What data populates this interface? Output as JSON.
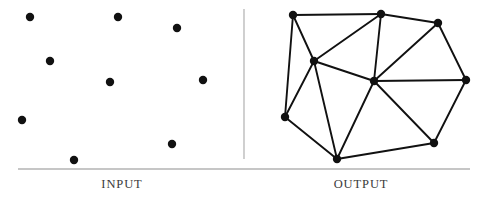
{
  "figure": {
    "width": 487,
    "height": 199,
    "background_color": "#ffffff",
    "ink_color": "#111111",
    "rule_color": "#8e8e8e",
    "divider_color": "#b0b0b0"
  },
  "divider": {
    "name": "vertical-divider",
    "x": 244,
    "y1": 9,
    "y2": 159
  },
  "baseline": {
    "name": "horizontal-rule",
    "x1": 18,
    "x2": 470,
    "y": 169
  },
  "panels": [
    {
      "id": "input",
      "caption": "INPUT",
      "description": "Scattered point set",
      "point_radius": 4.2,
      "points": [
        {
          "id": "p0",
          "x": 30,
          "y": 17
        },
        {
          "id": "p1",
          "x": 118,
          "y": 17
        },
        {
          "id": "p2",
          "x": 177,
          "y": 28
        },
        {
          "id": "p3",
          "x": 50,
          "y": 61
        },
        {
          "id": "p4",
          "x": 110,
          "y": 82
        },
        {
          "id": "p5",
          "x": 203,
          "y": 80
        },
        {
          "id": "p6",
          "x": 22,
          "y": 120
        },
        {
          "id": "p7",
          "x": 172,
          "y": 144
        },
        {
          "id": "p8",
          "x": 74,
          "y": 160
        }
      ]
    },
    {
      "id": "output",
      "caption": "OUTPUT",
      "description": "Triangulated point set",
      "point_radius": 4.2,
      "edge_width": 1.9,
      "points": [
        {
          "id": "q0",
          "x": 293,
          "y": 15
        },
        {
          "id": "q1",
          "x": 381,
          "y": 14
        },
        {
          "id": "q2",
          "x": 438,
          "y": 23
        },
        {
          "id": "q3",
          "x": 314,
          "y": 61
        },
        {
          "id": "q4",
          "x": 374,
          "y": 81
        },
        {
          "id": "q5",
          "x": 466,
          "y": 80
        },
        {
          "id": "q6",
          "x": 285,
          "y": 117
        },
        {
          "id": "q7",
          "x": 434,
          "y": 143
        },
        {
          "id": "q8",
          "x": 337,
          "y": 159
        }
      ],
      "edges": [
        [
          "q0",
          "q1"
        ],
        [
          "q1",
          "q2"
        ],
        [
          "q2",
          "q5"
        ],
        [
          "q5",
          "q7"
        ],
        [
          "q7",
          "q8"
        ],
        [
          "q8",
          "q6"
        ],
        [
          "q6",
          "q0"
        ],
        [
          "q0",
          "q3"
        ],
        [
          "q3",
          "q1"
        ],
        [
          "q1",
          "q4"
        ],
        [
          "q4",
          "q2"
        ],
        [
          "q4",
          "q5"
        ],
        [
          "q4",
          "q7"
        ],
        [
          "q4",
          "q8"
        ],
        [
          "q4",
          "q3"
        ],
        [
          "q3",
          "q6"
        ],
        [
          "q3",
          "q8"
        ]
      ],
      "triangles": [
        [
          "q0",
          "q1",
          "q3"
        ],
        [
          "q1",
          "q3",
          "q4"
        ],
        [
          "q1",
          "q2",
          "q4"
        ],
        [
          "q2",
          "q4",
          "q5"
        ],
        [
          "q4",
          "q5",
          "q7"
        ],
        [
          "q4",
          "q7",
          "q8"
        ],
        [
          "q3",
          "q4",
          "q8"
        ],
        [
          "q3",
          "q6",
          "q8"
        ],
        [
          "q0",
          "q3",
          "q6"
        ]
      ]
    }
  ]
}
